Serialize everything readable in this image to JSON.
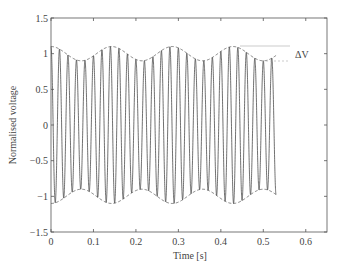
{
  "chart_data": {
    "type": "line",
    "title": "",
    "xlabel": "Time [s]",
    "ylabel": "Normalised voltage",
    "xlim": [
      0,
      0.65
    ],
    "ylim": [
      -1.5,
      1.5
    ],
    "x_ticks": [
      0,
      0.1,
      0.2,
      0.3,
      0.4,
      0.5,
      0.6
    ],
    "x_tick_labels": [
      "0",
      "0.1",
      "0.2",
      "0.3",
      "0.4",
      "0.5",
      "0.6"
    ],
    "y_ticks": [
      -1.5,
      -1,
      -0.5,
      0,
      0.5,
      1,
      1.5
    ],
    "y_tick_labels": [
      "−1.5",
      "−1",
      "−0.5",
      "0",
      "0.5",
      "1",
      "1.5"
    ],
    "grid": false,
    "legend": null,
    "series": [
      {
        "name": "voltage",
        "style": "solid",
        "description": "50 Hz carrier amplitude-modulated by ~7 Hz, depth 0.1",
        "carrier_frequency_hz": 50,
        "modulation_frequency_hz": 7,
        "modulation_depth": 0.1,
        "t_start": 0,
        "t_end": 0.53,
        "envelope_max": 1.1,
        "envelope_min": 0.9
      },
      {
        "name": "upper envelope",
        "style": "dashed",
        "formula": "1 + 0.1*cos(2*pi*7*t)"
      },
      {
        "name": "lower envelope",
        "style": "dashed",
        "formula": "-(1 + 0.1*cos(2*pi*7*t))"
      }
    ],
    "annotations": [
      {
        "text": "ΔV",
        "x": 0.57,
        "y": 0.95,
        "description": "Voltage fluctuation between envelope max and min"
      }
    ]
  }
}
